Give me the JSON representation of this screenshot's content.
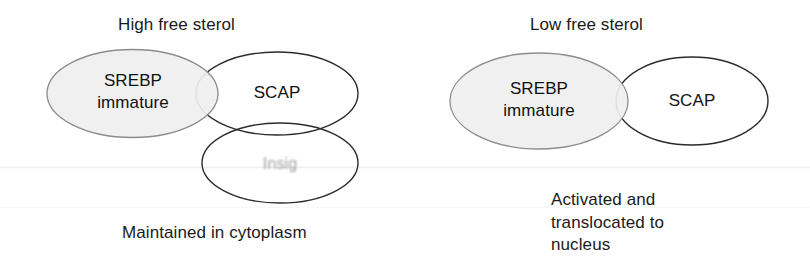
{
  "figure": {
    "type": "diagram",
    "background": "#ffffff",
    "text_color": "#1a1a1a",
    "shaded_fill": "#efeff0",
    "shaded_stroke": "#8c8c90",
    "plain_stroke": "#2b2b2b"
  },
  "panels": [
    {
      "id": "high-sterol",
      "title": "High free sterol",
      "caption": "Maintained in cytoplasm",
      "nodes": [
        {
          "id": "srebp-left",
          "lines": [
            "SREBP",
            "immature"
          ],
          "shaded": true,
          "faded": false
        },
        {
          "id": "scap-left",
          "lines": [
            "SCAP"
          ],
          "shaded": false,
          "faded": false
        },
        {
          "id": "insig",
          "lines": [
            "Insig"
          ],
          "shaded": false,
          "faded": true
        }
      ]
    },
    {
      "id": "low-sterol",
      "title": "Low free sterol",
      "caption": "Activated and\ntranslocated to\nnucleus",
      "caption_lines": [
        "Activated and",
        "translocated to",
        "nucleus"
      ],
      "nodes": [
        {
          "id": "srebp-right",
          "lines": [
            "SREBP",
            "immature"
          ],
          "shaded": true,
          "faded": false
        },
        {
          "id": "scap-right",
          "lines": [
            "SCAP"
          ],
          "shaded": false,
          "faded": false
        }
      ]
    }
  ],
  "labels": {
    "high_title": "High free sterol",
    "high_caption": "Maintained in cytoplasm",
    "low_title": "Low free sterol",
    "low_caption_1": "Activated and",
    "low_caption_2": "translocated to",
    "low_caption_3": "nucleus",
    "srebp_1": "SREBP",
    "srebp_2": "immature",
    "scap": "SCAP",
    "insig": "Insig"
  }
}
